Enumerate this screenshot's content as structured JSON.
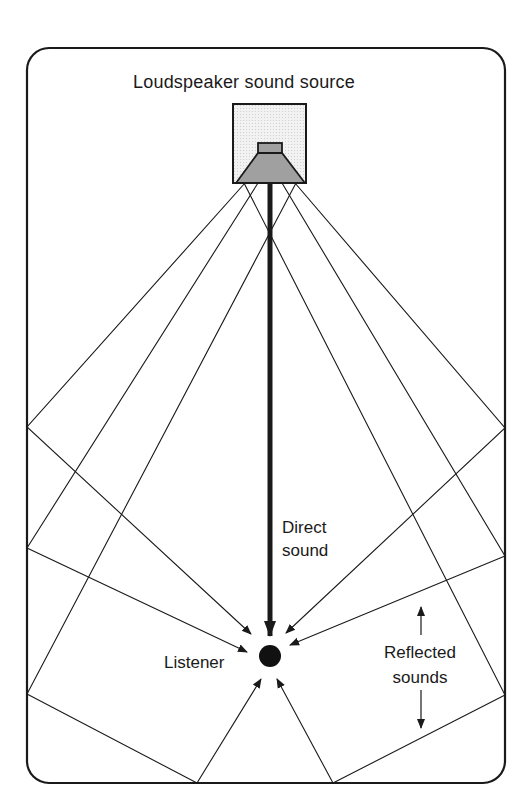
{
  "diagram": {
    "title": "Loudspeaker sound source",
    "labels": {
      "direct_line1": "Direct",
      "direct_line2": "sound",
      "listener": "Listener",
      "reflected_line1": "Reflected",
      "reflected_line2": "sounds"
    },
    "colors": {
      "line": "#1a1a1a",
      "speaker_box_fill": "#ececec",
      "speaker_cone_fill": "#a0a0a0",
      "background": "#ffffff"
    },
    "room": {
      "x": 27,
      "y": 48,
      "width": 478,
      "height": 735,
      "corner_radius": 22
    },
    "speaker": {
      "box": {
        "x": 233,
        "y": 104,
        "width": 73,
        "height": 79
      },
      "magnet": {
        "x": 258,
        "y": 143,
        "width": 24,
        "height": 10
      },
      "cone": "258,153 282,153 305,183 236,183"
    },
    "listener": {
      "cx": 270,
      "cy": 656,
      "r": 11
    },
    "direct_path": {
      "x1": 270,
      "y1": 183,
      "x2": 270,
      "y2": 635
    },
    "reflected_paths": [
      {
        "points": "245,183 27,427 251,634",
        "wall": "left",
        "order": 1
      },
      {
        "points": "258,183 27,548 247,652",
        "wall": "left",
        "order": 2
      },
      {
        "points": "296,183 27,694 197,783 261,679",
        "wall": "left+floor",
        "order": 3
      },
      {
        "points": "295,183 505,428 286,633",
        "wall": "right",
        "order": 1
      },
      {
        "points": "282,183 505,556 290,645",
        "wall": "right",
        "order": 2
      },
      {
        "points": "244,183 505,695 333,783 277,679",
        "wall": "right+floor",
        "order": 3
      }
    ],
    "label_arrows": {
      "up": {
        "x": 421,
        "y1": 635,
        "y2": 607
      },
      "down": {
        "x": 421,
        "y1": 690,
        "y2": 728
      }
    }
  }
}
